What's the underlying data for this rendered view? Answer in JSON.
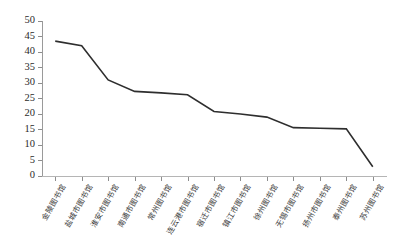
{
  "chart_data": {
    "type": "line",
    "title": "",
    "subtitle": "",
    "xlabel": "",
    "ylabel": "",
    "ylim": [
      0,
      50
    ],
    "ytick_step": 5,
    "grid": false,
    "legend": false,
    "legend_position": "none",
    "line_color": "#2e2e2e",
    "categories": [
      "金陵图书馆",
      "盐城市图书馆",
      "淮安市图书馆",
      "南通市图书馆",
      "常州图书馆",
      "连云港市图书馆",
      "宿迁市图书馆",
      "镇江市图书馆",
      "徐州图书馆",
      "无锡市图书馆",
      "扬州市图书馆",
      "泰州图书馆",
      "苏州图书馆"
    ],
    "values": [
      43.5,
      42,
      31,
      27.3,
      26.8,
      26.2,
      20.8,
      20,
      19,
      15.6,
      15.4,
      15.2,
      3
    ],
    "ytick_labels": [
      "0",
      "5",
      "10",
      "15",
      "20",
      "25",
      "30",
      "35",
      "40",
      "45",
      "50"
    ],
    "ytick_values": [
      0,
      5,
      10,
      15,
      20,
      25,
      30,
      35,
      40,
      45,
      50
    ],
    "series": [
      {
        "name": "",
        "values": [
          43.5,
          42,
          31,
          27.3,
          26.8,
          26.2,
          20.8,
          20,
          19,
          15.6,
          15.4,
          15.2,
          3
        ]
      }
    ]
  },
  "colors": {
    "line": "#2e2e2e",
    "axis": "#9a9a9a",
    "tick_text": "#2b2b2b",
    "label_text": "#3a3a3a",
    "background": "#ffffff"
  }
}
